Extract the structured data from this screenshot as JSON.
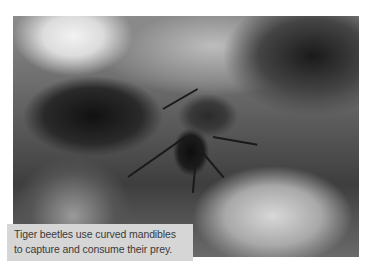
{
  "photo": {
    "subject": "tiger beetle on wood",
    "tone": "black-and-white"
  },
  "caption": {
    "text": "Tiger beetles use curved mandibles to capture and consume their prey."
  }
}
